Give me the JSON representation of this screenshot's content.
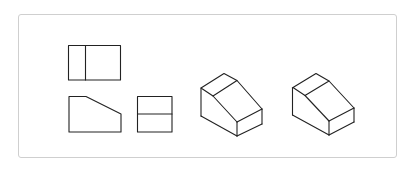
{
  "figure": {
    "line_color": "#222222",
    "border_color": "#cfcfcf",
    "background": "#ffffff"
  },
  "views": [
    {
      "name": "top-view",
      "label": ""
    },
    {
      "name": "front-view",
      "label": ""
    },
    {
      "name": "side-view",
      "label": ""
    },
    {
      "name": "isometric-view-1",
      "label": ""
    },
    {
      "name": "isometric-view-2",
      "label": ""
    }
  ]
}
